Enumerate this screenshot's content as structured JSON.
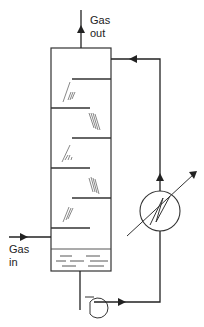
{
  "diagram": {
    "labels": {
      "gas_out_line1": "Gas",
      "gas_out_line2": "out",
      "gas_in_line1": "Gas",
      "gas_in_line2": "in"
    },
    "components": [
      {
        "id": "column",
        "type": "tray-column",
        "trays": 6
      },
      {
        "id": "liquid-sump",
        "type": "liquid-pool"
      },
      {
        "id": "pump",
        "type": "centrifugal-pump"
      },
      {
        "id": "heat-exchanger",
        "type": "heat-exchanger"
      },
      {
        "id": "recycle-line",
        "type": "pipe",
        "flow": "upward then into column top"
      }
    ],
    "colors": {
      "line": "#222222",
      "background": "#ffffff"
    }
  }
}
